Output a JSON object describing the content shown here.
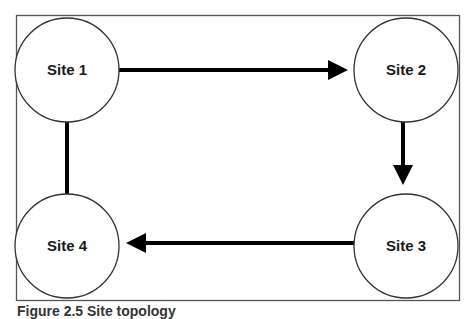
{
  "diagram": {
    "type": "flow",
    "frame": {
      "x": 16,
      "y": 15,
      "width": 443,
      "height": 285,
      "stroke": "#555555"
    },
    "nodes": [
      {
        "id": "site1",
        "label": "Site 1",
        "cx": 67,
        "cy": 70,
        "r": 52
      },
      {
        "id": "site2",
        "label": "Site 2",
        "cx": 406,
        "cy": 70,
        "r": 52
      },
      {
        "id": "site3",
        "label": "Site 3",
        "cx": 406,
        "cy": 246,
        "r": 52
      },
      {
        "id": "site4",
        "label": "Site 4",
        "cx": 67,
        "cy": 246,
        "r": 52
      }
    ],
    "edges": [
      {
        "from": "site1",
        "to": "site2"
      },
      {
        "from": "site2",
        "to": "site3"
      },
      {
        "from": "site3",
        "to": "site4"
      },
      {
        "from": "site4",
        "to": "site1"
      }
    ],
    "colors": {
      "node_stroke": "#333333",
      "arrow": "#000000",
      "text": "#1a1a1a"
    }
  },
  "caption": "Figure 2.5  Site topology"
}
